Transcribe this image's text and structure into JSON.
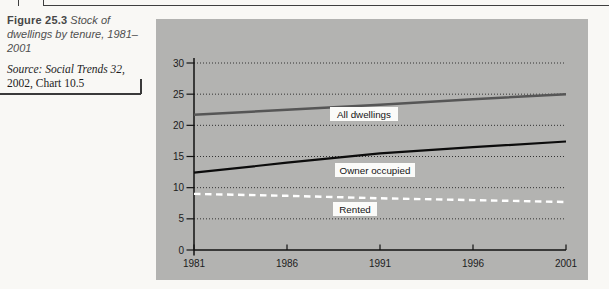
{
  "caption": {
    "figure_label": "Figure 25.3",
    "figure_title": "Stock of dwellings by tenure, 1981–2001",
    "source_prefix": "Source:",
    "source_work": "Social Trends 32,",
    "source_detail": "2002, Chart 10.5"
  },
  "chart_data": {
    "type": "line",
    "title": "United Kingdom",
    "subtitle": "Millions",
    "x": [
      1981,
      1986,
      1991,
      1996,
      2001
    ],
    "x_tick_labels": [
      "1981",
      "1986",
      "1991",
      "1996",
      "2001"
    ],
    "y_ticks": [
      0,
      5,
      10,
      15,
      20,
      25,
      30
    ],
    "xlim": [
      1981,
      2001
    ],
    "ylim": [
      0,
      30
    ],
    "grid": "horizontal-dotted",
    "legend_position": "inline-labels",
    "series": [
      {
        "name": "All dwellings",
        "values": [
          21.7,
          22.5,
          23.3,
          24.2,
          25.0
        ],
        "color": "#565656",
        "style": "solid",
        "width": 2.6
      },
      {
        "name": "Owner occupied",
        "values": [
          12.4,
          14.0,
          15.5,
          16.5,
          17.4
        ],
        "color": "#0c0c0c",
        "style": "solid",
        "width": 2.2
      },
      {
        "name": "Rented",
        "values": [
          9.0,
          8.7,
          8.3,
          8.0,
          7.7
        ],
        "color": "#ffffff",
        "style": "dashed",
        "width": 2.4
      }
    ],
    "colors": {
      "panel_bg": "#b3b3b1",
      "grid": "#323232",
      "axis": "#121212",
      "tick_text": "#1c1c1c",
      "label_box_bg": "#fbfbf9",
      "label_text": "#141414"
    }
  }
}
